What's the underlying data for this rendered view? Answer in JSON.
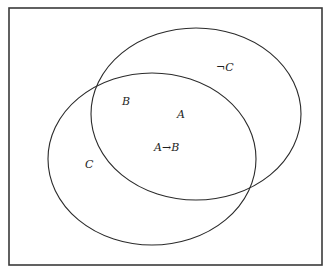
{
  "diagram": {
    "type": "venn",
    "frame": {
      "x": 9,
      "y": 8,
      "width": 313,
      "height": 257,
      "stroke": "#3a3a3a"
    },
    "ellipses": [
      {
        "name": "upper-right-set",
        "cx": 196,
        "cy": 114,
        "rx": 105,
        "ry": 86
      },
      {
        "name": "lower-left-set",
        "cx": 152,
        "cy": 159,
        "rx": 104,
        "ry": 86
      }
    ],
    "labels": {
      "not_c": "¬C",
      "b": "B",
      "a": "A",
      "a_implies_b": "A→B",
      "c": "C"
    },
    "line_color": "#2a2a2a",
    "background": "#ffffff"
  }
}
